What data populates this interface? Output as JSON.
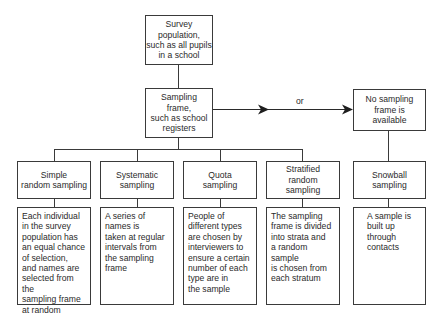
{
  "diagram": {
    "survey_population": "Survey\npopulation,\nsuch as all pupils\nin a school",
    "sampling_frame": "Sampling\nframe,\nsuch as school\nregisters",
    "or_label": "or",
    "no_sampling_frame": "No sampling\nframe is\navailable",
    "methods": [
      {
        "title": "Simple\nrandom sampling",
        "description": "Each individual\nin the survey\npopulation has\nan equal chance\nof selection,\nand names are\nselected from the\nsampling frame\nat random"
      },
      {
        "title": "Systematic\nsampling",
        "description": "A series of\nnames is\ntaken at regular\nintervals from\nthe sampling\nframe"
      },
      {
        "title": "Quota\nsampling",
        "description": "People of\ndifferent types\nare chosen by\ninterviewers to\nensure a certain\nnumber of each\ntype are in\nthe sample"
      },
      {
        "title": "Stratified\nrandom\nsampling",
        "description": "The sampling\nframe is divided\ninto strata and\na random sample\nis chosen from\neach stratum"
      },
      {
        "title": "Snowball\nsampling",
        "description": "A sample is\nbuilt up\nthrough\ncontacts"
      }
    ]
  }
}
